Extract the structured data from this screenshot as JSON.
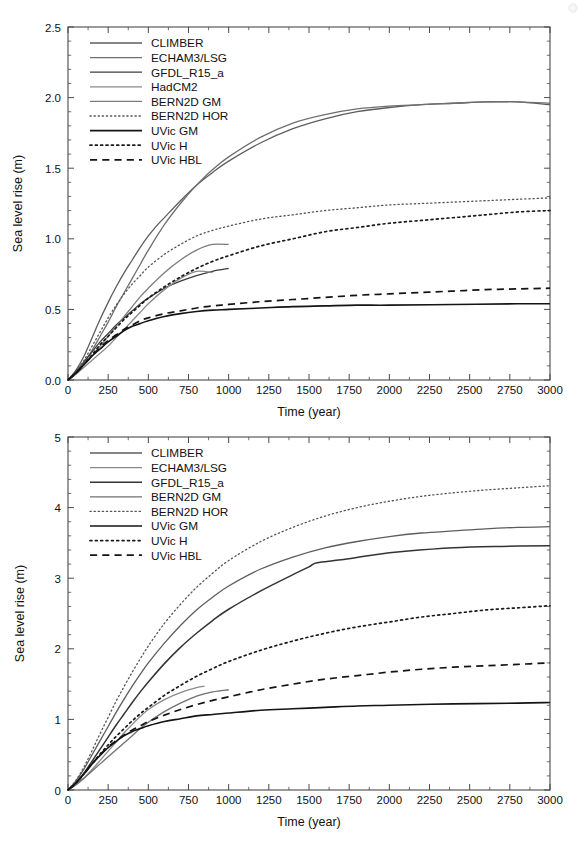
{
  "figure": {
    "panels": [
      "top",
      "bottom"
    ],
    "background": "#ffffff",
    "axis_color": "#4a4a4a"
  },
  "chart_data": [
    {
      "id": "top",
      "type": "line",
      "title": "",
      "xlabel": "Time (year)",
      "ylabel": "Sea level rise (m)",
      "xlim": [
        0,
        3000
      ],
      "ylim": [
        0.0,
        2.5
      ],
      "xticks": [
        0,
        250,
        500,
        750,
        1000,
        1250,
        1500,
        1750,
        2000,
        2250,
        2500,
        2750,
        3000
      ],
      "xticklabels": [
        "0",
        "250",
        "500",
        "750",
        "1000",
        "1250",
        "1500",
        "1750",
        "2000",
        "2250",
        "2500",
        "2750",
        "3000"
      ],
      "yticks": [
        0.0,
        0.5,
        1.0,
        1.5,
        2.0,
        2.5
      ],
      "yticklabels": [
        "0.0",
        "0.5",
        "1.0",
        "1.5",
        "2.0",
        "2.5"
      ],
      "minor_x_per_major": 2,
      "minor_y_per_major": 5,
      "grid": false,
      "legend_position": "upper-left",
      "series": [
        {
          "name": "CLIMBER",
          "style": "solid",
          "color": "#5d5d5d",
          "width": 1.3,
          "x": [
            0,
            50,
            100,
            150,
            200,
            250,
            300,
            350,
            400,
            450,
            500,
            550,
            600,
            700,
            800,
            900,
            1000,
            1200,
            1400,
            1600,
            1800,
            2000,
            2200,
            2400,
            2600,
            2700,
            2800,
            3000
          ],
          "y": [
            0.0,
            0.07,
            0.17,
            0.3,
            0.43,
            0.55,
            0.66,
            0.76,
            0.85,
            0.94,
            1.02,
            1.09,
            1.15,
            1.27,
            1.38,
            1.47,
            1.55,
            1.68,
            1.78,
            1.85,
            1.9,
            1.93,
            1.95,
            1.96,
            1.97,
            1.97,
            1.97,
            1.95
          ]
        },
        {
          "name": "ECHAM3/LSG",
          "style": "solid",
          "color": "#6f6f6f",
          "width": 1.3,
          "x": [
            0,
            50,
            100,
            150,
            200,
            250,
            300,
            350,
            400,
            450,
            500,
            600,
            700,
            800,
            900,
            1000,
            1200,
            1400,
            1600,
            1800,
            2000,
            2200,
            2400,
            2600,
            2800,
            3000
          ],
          "y": [
            0.0,
            0.05,
            0.12,
            0.21,
            0.31,
            0.41,
            0.52,
            0.62,
            0.72,
            0.82,
            0.92,
            1.1,
            1.25,
            1.38,
            1.49,
            1.58,
            1.72,
            1.82,
            1.88,
            1.92,
            1.94,
            1.95,
            1.96,
            1.97,
            1.97,
            1.96
          ]
        },
        {
          "name": "GFDL_R15_a",
          "style": "solid",
          "color": "#3c3c3c",
          "width": 1.3,
          "x": [
            0,
            50,
            100,
            150,
            200,
            250,
            300,
            350,
            400,
            450,
            500,
            600,
            700,
            800,
            900,
            1000
          ],
          "y": [
            0.0,
            0.06,
            0.13,
            0.2,
            0.27,
            0.33,
            0.39,
            0.44,
            0.49,
            0.54,
            0.58,
            0.65,
            0.7,
            0.74,
            0.77,
            0.79
          ]
        },
        {
          "name": "HadCM2",
          "style": "solid",
          "color": "#8a8a8a",
          "width": 1.3,
          "x": [
            0,
            50,
            100,
            150,
            200,
            250,
            300,
            350,
            400,
            450,
            500,
            600,
            700,
            800,
            900
          ],
          "y": [
            0.0,
            0.04,
            0.09,
            0.14,
            0.19,
            0.24,
            0.3,
            0.36,
            0.42,
            0.48,
            0.54,
            0.64,
            0.72,
            0.77,
            0.76
          ]
        },
        {
          "name": "BERN2D GM",
          "style": "solid",
          "color": "#7c7c7c",
          "width": 1.3,
          "x": [
            0,
            50,
            100,
            150,
            200,
            250,
            300,
            350,
            400,
            450,
            500,
            600,
            700,
            800,
            900,
            1000
          ],
          "y": [
            0.0,
            0.05,
            0.11,
            0.17,
            0.24,
            0.31,
            0.38,
            0.45,
            0.52,
            0.59,
            0.65,
            0.76,
            0.85,
            0.92,
            0.96,
            0.96
          ]
        },
        {
          "name": "BERN2D HOR",
          "style": "dotted",
          "color": "#555555",
          "width": 1.3,
          "x": [
            0,
            50,
            100,
            150,
            200,
            250,
            300,
            350,
            400,
            450,
            500,
            600,
            700,
            800,
            900,
            1000,
            1200,
            1400,
            1600,
            1800,
            2000,
            2200,
            2400,
            2600,
            2800,
            3000
          ],
          "y": [
            0.0,
            0.06,
            0.14,
            0.24,
            0.34,
            0.44,
            0.53,
            0.61,
            0.68,
            0.74,
            0.8,
            0.89,
            0.96,
            1.02,
            1.06,
            1.09,
            1.14,
            1.17,
            1.2,
            1.22,
            1.24,
            1.25,
            1.26,
            1.27,
            1.28,
            1.29
          ]
        },
        {
          "name": "UVic GM",
          "style": "solid",
          "color": "#141414",
          "width": 1.6,
          "x": [
            0,
            50,
            100,
            150,
            200,
            250,
            300,
            350,
            400,
            450,
            500,
            600,
            700,
            800,
            900,
            1000,
            1200,
            1400,
            1600,
            1800,
            2000,
            2400,
            2800,
            3000
          ],
          "y": [
            0.0,
            0.05,
            0.11,
            0.17,
            0.22,
            0.27,
            0.31,
            0.35,
            0.38,
            0.4,
            0.42,
            0.45,
            0.47,
            0.485,
            0.495,
            0.5,
            0.51,
            0.52,
            0.525,
            0.53,
            0.53,
            0.535,
            0.54,
            0.54
          ]
        },
        {
          "name": "UVic H",
          "style": "dotted-bold",
          "color": "#1a1a1a",
          "width": 1.7,
          "x": [
            0,
            50,
            100,
            150,
            200,
            250,
            300,
            350,
            400,
            450,
            500,
            600,
            700,
            800,
            900,
            1000,
            1200,
            1400,
            1600,
            1800,
            2000,
            2200,
            2400,
            2600,
            2800,
            3000
          ],
          "y": [
            0.0,
            0.05,
            0.11,
            0.18,
            0.25,
            0.31,
            0.37,
            0.43,
            0.48,
            0.53,
            0.58,
            0.66,
            0.73,
            0.79,
            0.84,
            0.88,
            0.95,
            1.0,
            1.05,
            1.08,
            1.11,
            1.13,
            1.15,
            1.17,
            1.19,
            1.2
          ]
        },
        {
          "name": "UVic HBL",
          "style": "dashed",
          "color": "#141414",
          "width": 1.7,
          "x": [
            0,
            50,
            100,
            150,
            200,
            250,
            300,
            350,
            400,
            450,
            500,
            600,
            700,
            800,
            900,
            1000,
            1200,
            1400,
            1600,
            1800,
            2000,
            2200,
            2400,
            2600,
            2800,
            3000
          ],
          "y": [
            0.0,
            0.05,
            0.11,
            0.17,
            0.23,
            0.28,
            0.32,
            0.36,
            0.39,
            0.42,
            0.44,
            0.47,
            0.49,
            0.51,
            0.525,
            0.535,
            0.555,
            0.57,
            0.585,
            0.6,
            0.61,
            0.62,
            0.63,
            0.64,
            0.645,
            0.65
          ]
        }
      ]
    },
    {
      "id": "bottom",
      "type": "line",
      "title": "",
      "xlabel": "Time (year)",
      "ylabel": "Sea level rise (m)",
      "xlim": [
        0,
        3000
      ],
      "ylim": [
        0,
        5
      ],
      "xticks": [
        0,
        250,
        500,
        750,
        1000,
        1250,
        1500,
        1750,
        2000,
        2250,
        2500,
        2750,
        3000
      ],
      "xticklabels": [
        "0",
        "250",
        "500",
        "750",
        "1000",
        "1250",
        "1500",
        "1750",
        "2000",
        "2250",
        "2500",
        "2750",
        "3000"
      ],
      "yticks": [
        0,
        1,
        2,
        3,
        4,
        5
      ],
      "yticklabels": [
        "0",
        "1",
        "2",
        "3",
        "4",
        "5"
      ],
      "minor_x_per_major": 2,
      "minor_y_per_major": 5,
      "grid": false,
      "legend_position": "upper-left",
      "series": [
        {
          "name": "CLIMBER",
          "style": "solid",
          "color": "#5d5d5d",
          "width": 1.3,
          "x": [
            0,
            50,
            100,
            150,
            200,
            250,
            300,
            350,
            400,
            450,
            500,
            600,
            700,
            800,
            900,
            1000,
            1200,
            1400,
            1600,
            1800,
            2000,
            2200,
            2400,
            2600,
            2800,
            3000
          ],
          "y": [
            0.0,
            0.13,
            0.3,
            0.5,
            0.7,
            0.9,
            1.1,
            1.29,
            1.47,
            1.64,
            1.8,
            2.08,
            2.33,
            2.55,
            2.73,
            2.89,
            3.13,
            3.3,
            3.43,
            3.52,
            3.59,
            3.64,
            3.67,
            3.7,
            3.72,
            3.73
          ]
        },
        {
          "name": "ECHAM3/LSG",
          "style": "solid",
          "color": "#8a8a8a",
          "width": 1.3,
          "x": [
            0,
            50,
            100,
            150,
            200,
            250,
            300,
            350,
            400,
            450,
            500,
            600,
            700,
            800,
            850
          ],
          "y": [
            0.0,
            0.07,
            0.17,
            0.29,
            0.42,
            0.55,
            0.68,
            0.81,
            0.93,
            1.04,
            1.14,
            1.28,
            1.38,
            1.45,
            1.47
          ]
        },
        {
          "name": "GFDL_R15_a",
          "style": "solid",
          "color": "#333333",
          "width": 1.5,
          "x": [
            0,
            50,
            100,
            150,
            200,
            250,
            300,
            350,
            400,
            450,
            500,
            600,
            700,
            800,
            900,
            1000,
            1200,
            1400,
            1500,
            1550,
            1700,
            1900,
            2100,
            2400,
            2700,
            3000
          ],
          "y": [
            0.0,
            0.1,
            0.24,
            0.41,
            0.58,
            0.75,
            0.92,
            1.08,
            1.24,
            1.39,
            1.53,
            1.79,
            2.02,
            2.22,
            2.4,
            2.56,
            2.82,
            3.05,
            3.16,
            3.22,
            3.26,
            3.33,
            3.38,
            3.43,
            3.45,
            3.46
          ]
        },
        {
          "name": "BERN2D GM",
          "style": "solid",
          "color": "#707070",
          "width": 1.3,
          "x": [
            0,
            50,
            100,
            150,
            200,
            250,
            300,
            350,
            400,
            450,
            500,
            600,
            700,
            800,
            900,
            1000
          ],
          "y": [
            0.0,
            0.08,
            0.17,
            0.27,
            0.37,
            0.47,
            0.57,
            0.67,
            0.77,
            0.87,
            0.96,
            1.11,
            1.23,
            1.33,
            1.39,
            1.42
          ]
        },
        {
          "name": "BERN2D HOR",
          "style": "dotted",
          "color": "#555555",
          "width": 1.3,
          "x": [
            0,
            50,
            100,
            150,
            200,
            250,
            300,
            350,
            400,
            450,
            500,
            600,
            700,
            800,
            900,
            1000,
            1200,
            1400,
            1600,
            1800,
            2000,
            2200,
            2400,
            2600,
            2800,
            3000
          ],
          "y": [
            0.0,
            0.14,
            0.33,
            0.56,
            0.8,
            1.03,
            1.26,
            1.47,
            1.67,
            1.86,
            2.04,
            2.36,
            2.63,
            2.87,
            3.07,
            3.25,
            3.52,
            3.72,
            3.88,
            4.0,
            4.09,
            4.16,
            4.21,
            4.25,
            4.28,
            4.31
          ]
        },
        {
          "name": "UVic GM",
          "style": "solid",
          "color": "#141414",
          "width": 1.6,
          "x": [
            0,
            50,
            100,
            150,
            200,
            250,
            300,
            350,
            400,
            450,
            500,
            600,
            700,
            800,
            900,
            1000,
            1200,
            1400,
            1600,
            1800,
            2000,
            2400,
            2800,
            3000
          ],
          "y": [
            0.0,
            0.1,
            0.23,
            0.37,
            0.49,
            0.6,
            0.69,
            0.77,
            0.83,
            0.87,
            0.91,
            0.97,
            1.01,
            1.05,
            1.07,
            1.09,
            1.13,
            1.15,
            1.17,
            1.19,
            1.2,
            1.22,
            1.23,
            1.24
          ]
        },
        {
          "name": "UVic H",
          "style": "dotted-bold",
          "color": "#1a1a1a",
          "width": 1.7,
          "x": [
            0,
            50,
            100,
            150,
            200,
            250,
            300,
            350,
            400,
            450,
            500,
            600,
            700,
            800,
            900,
            1000,
            1200,
            1400,
            1600,
            1800,
            2000,
            2200,
            2400,
            2600,
            2800,
            3000
          ],
          "y": [
            0.0,
            0.1,
            0.23,
            0.37,
            0.51,
            0.64,
            0.76,
            0.87,
            0.98,
            1.08,
            1.17,
            1.34,
            1.48,
            1.61,
            1.72,
            1.82,
            1.98,
            2.11,
            2.22,
            2.31,
            2.38,
            2.45,
            2.5,
            2.55,
            2.58,
            2.61
          ]
        },
        {
          "name": "UVic HBL",
          "style": "dashed",
          "color": "#141414",
          "width": 1.7,
          "x": [
            0,
            50,
            100,
            150,
            200,
            250,
            300,
            350,
            400,
            450,
            500,
            600,
            700,
            800,
            900,
            1000,
            1200,
            1400,
            1600,
            1800,
            2000,
            2200,
            2400,
            2600,
            2800,
            3000
          ],
          "y": [
            0.0,
            0.1,
            0.23,
            0.37,
            0.5,
            0.61,
            0.7,
            0.78,
            0.85,
            0.91,
            0.97,
            1.06,
            1.14,
            1.21,
            1.27,
            1.32,
            1.42,
            1.5,
            1.57,
            1.62,
            1.67,
            1.71,
            1.74,
            1.76,
            1.78,
            1.8
          ]
        }
      ]
    }
  ]
}
